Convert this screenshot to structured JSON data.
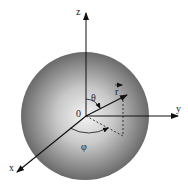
{
  "diagram": {
    "labels": {
      "z_axis": "z",
      "y_axis": "y",
      "x_axis": "x",
      "origin": "0",
      "vector": "r",
      "polar_angle": "θ",
      "azimuth_angle": "φ"
    },
    "colors": {
      "sphere_light": "#f2f2f2",
      "sphere_dark": "#6a6a6a",
      "axis": "#111111"
    }
  }
}
